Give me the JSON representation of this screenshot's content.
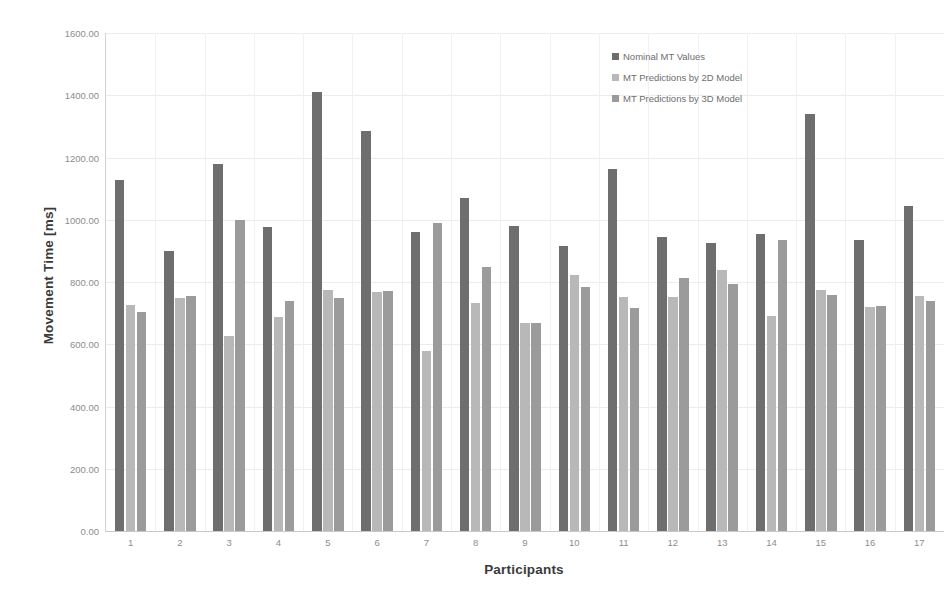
{
  "title_strip": "",
  "chart_data": {
    "type": "bar",
    "title": "",
    "xlabel": "Participants",
    "ylabel": "Movement Time [ms]",
    "ylim": [
      0,
      1600
    ],
    "ytick_step": 200,
    "ytick_labels": [
      "0.00",
      "200.00",
      "400.00",
      "600.00",
      "800.00",
      "1000.00",
      "1200.00",
      "1400.00",
      "1600.00"
    ],
    "ytick_values": [
      0,
      200,
      400,
      600,
      800,
      1000,
      1200,
      1400,
      1600
    ],
    "grid": true,
    "legend_position": "upper-right-inside",
    "categories": [
      "1",
      "2",
      "3",
      "4",
      "5",
      "6",
      "7",
      "8",
      "9",
      "10",
      "11",
      "12",
      "13",
      "14",
      "15",
      "16",
      "17"
    ],
    "series": [
      {
        "name": "Nominal MT Values",
        "color": "#6e6e6e",
        "values": [
          1127,
          900,
          1180,
          977,
          1412,
          1284,
          960,
          1069,
          980,
          915,
          1162,
          944,
          925,
          953,
          1341,
          934,
          1044
        ]
      },
      {
        "name": "MT Predictions by 2D Model",
        "color": "#b8b8b8",
        "values": [
          725,
          750,
          628,
          688,
          774,
          767,
          578,
          732,
          668,
          822,
          751,
          751,
          838,
          690,
          774,
          719,
          755
        ]
      },
      {
        "name": "MT Predictions by 3D Model",
        "color": "#9b9b9b",
        "values": [
          703,
          755,
          1000,
          739,
          748,
          770,
          990,
          848,
          668,
          783,
          718,
          812,
          793,
          934,
          758,
          722,
          739
        ]
      }
    ]
  },
  "legend": {
    "items": [
      {
        "label": "Nominal MT Values",
        "color": "#6e6e6e"
      },
      {
        "label": "MT Predictions by 2D Model",
        "color": "#b8b8b8"
      },
      {
        "label": "MT Predictions by 3D Model",
        "color": "#9b9b9b"
      }
    ]
  }
}
